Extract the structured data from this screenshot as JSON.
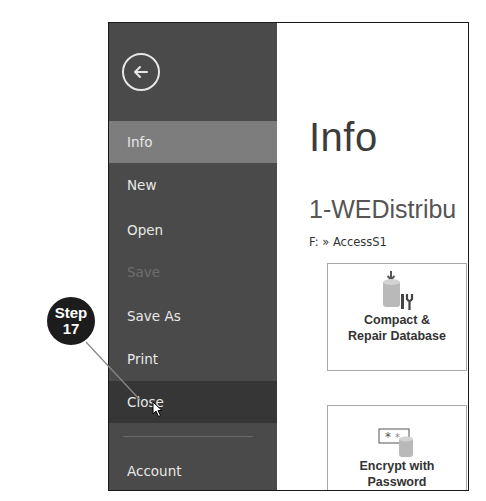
{
  "sidebar": {
    "back_icon": "arrow-left-circle-icon",
    "items": [
      {
        "label": "Info",
        "state": "active"
      },
      {
        "label": "New",
        "state": "normal"
      },
      {
        "label": "Open",
        "state": "normal"
      },
      {
        "label": "Save",
        "state": "disabled"
      },
      {
        "label": "Save As",
        "state": "normal"
      },
      {
        "label": "Print",
        "state": "normal"
      },
      {
        "label": "Close",
        "state": "hover"
      },
      {
        "label": "Account",
        "state": "normal"
      }
    ]
  },
  "main": {
    "title": "Info",
    "doc_name": "1-WEDistribu",
    "path": "F: » AccessS1",
    "tiles": [
      {
        "label_line1": "Compact &",
        "label_line2": "Repair Database",
        "icon": "compact-repair-database-icon"
      },
      {
        "label_line1": "Encrypt with",
        "label_line2": "Password",
        "icon": "encrypt-password-icon"
      }
    ]
  },
  "callout": {
    "line1": "Step",
    "line2": "17"
  },
  "colors": {
    "sidebar_bg": "#4a4a4a",
    "active_bg": "#7d7d7d",
    "hover_bg": "#363636"
  }
}
